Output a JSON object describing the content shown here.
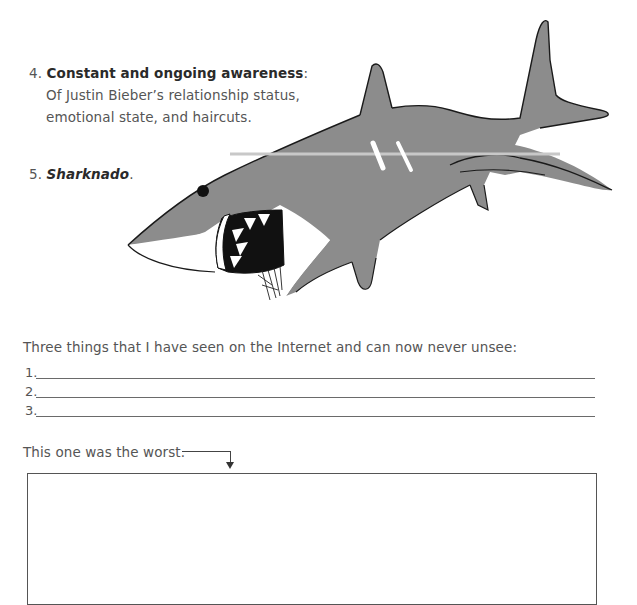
{
  "list": {
    "item4": {
      "number": "4.",
      "title": "Constant and ongoing awareness",
      "colon": ":",
      "description_line1": "Of Justin Bieber’s relationship status,",
      "description_line2": "emotional state, and haircuts."
    },
    "item5": {
      "number": "5.",
      "title": "Sharknado",
      "period": "."
    }
  },
  "illustration": {
    "subject": "shark-illustration",
    "body_color": "#8c8c8c",
    "outline_color": "#1a1a1a",
    "mouth_color": "#111111"
  },
  "prompts": {
    "three_things": "Three things that I have seen on the Internet and can now never unsee:",
    "blanks": [
      {
        "number": "1."
      },
      {
        "number": "2."
      },
      {
        "number": "3."
      }
    ],
    "worst_label": "This one was the worst."
  }
}
